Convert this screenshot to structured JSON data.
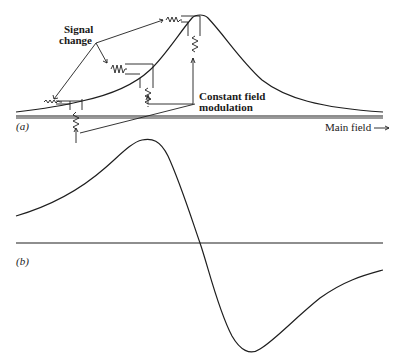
{
  "figure": {
    "panel_a": {
      "label": "(a)",
      "description": "Absorption line with field modulation",
      "annotations": {
        "signal_change_line1": "Signal",
        "signal_change_line2": "change",
        "constant_field_line1": "Constant field",
        "constant_field_line2": "modulation"
      },
      "axis_label": "Main field",
      "axis_arrow": "→"
    },
    "panel_b": {
      "label": "(b)",
      "description": "First derivative of absorption line"
    },
    "colors": {
      "ink": "#1e1e1e",
      "background": "#ffffff"
    }
  }
}
